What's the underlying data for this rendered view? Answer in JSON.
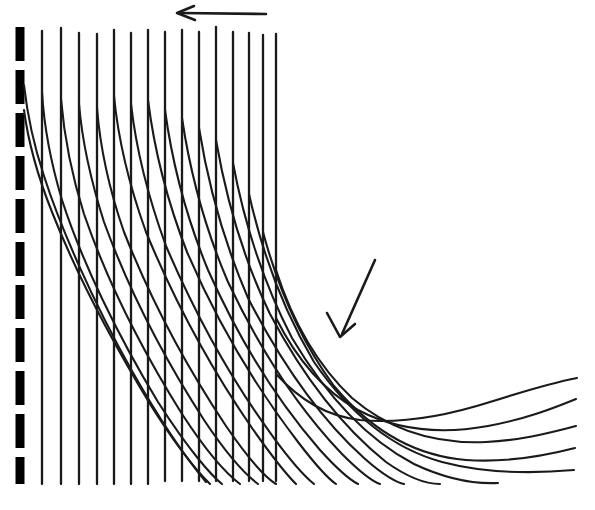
{
  "figure": {
    "domain": "diagram",
    "title": "",
    "background_color": "#ffffff",
    "ink_color": "#1a1a1a",
    "width": 595,
    "height": 510
  },
  "wall": {
    "name": "dashed-boundary-wall",
    "x": 20,
    "y_top": 27,
    "y_bottom": 484,
    "stroke_width": 9,
    "color": "#000000",
    "dash_pattern": "34 9"
  },
  "timelines": {
    "name": "vertical-timeline-markers",
    "count": 15,
    "color": "#1a1a1a",
    "stroke_width": 2.3,
    "y_top": 27,
    "items": [
      {
        "x": 42,
        "y_top": 31,
        "y_bottom": 484
      },
      {
        "x": 61,
        "y_top": 28,
        "y_bottom": 484
      },
      {
        "x": 79,
        "y_top": 33,
        "y_bottom": 484
      },
      {
        "x": 97,
        "y_top": 34,
        "y_bottom": 484
      },
      {
        "x": 114,
        "y_top": 30,
        "y_bottom": 484
      },
      {
        "x": 131,
        "y_top": 33,
        "y_bottom": 484
      },
      {
        "x": 148,
        "y_top": 30,
        "y_bottom": 484
      },
      {
        "x": 165,
        "y_top": 32,
        "y_bottom": 481
      },
      {
        "x": 182,
        "y_top": 30,
        "y_bottom": 481
      },
      {
        "x": 199,
        "y_top": 32,
        "y_bottom": 481
      },
      {
        "x": 216,
        "y_top": 27,
        "y_bottom": 481
      },
      {
        "x": 233,
        "y_top": 32,
        "y_bottom": 481
      },
      {
        "x": 249,
        "y_top": 33,
        "y_bottom": 481
      },
      {
        "x": 263,
        "y_top": 35,
        "y_bottom": 481
      },
      {
        "x": 276,
        "y_top": 34,
        "y_bottom": 481
      }
    ]
  },
  "streamlines": {
    "name": "curved-streamlines",
    "count": 18,
    "color": "#1a1a1a",
    "stroke_width": 2.1,
    "note": "Each curve starts on the wall or on a vertical marker and sweeps down-right, flattening into a near-horizontal tail at the right edge.",
    "paths": [
      "M 24,85 C 27,112 32,140 44,176 C 60,226 92,300 132,371 C 170,438 196,470 206,482",
      "M 24,110 C 28,140 36,172 52,212 C 74,268 110,338 150,404 C 180,452 200,474 210,484",
      "M 42,92 C 44,126 50,160 62,200 C 82,262 118,336 158,402 C 190,452 212,476 222,484",
      "M 61,99 C 64,134 70,170 84,214 C 106,278 142,350 182,414 C 212,460 232,478 240,484",
      "M 79,104 C 82,140 90,178 104,222 C 128,288 164,358 204,420 C 232,462 250,478 258,484",
      "M 97,108 C 100,146 108,186 124,232 C 150,298 186,366 226,426 C 252,464 268,479 276,484",
      "M 114,96 C 118,138 128,182 146,232 C 174,300 212,370 252,428 C 276,462 290,478 296,484",
      "M 131,104 C 136,148 147,194 166,246 C 196,316 234,384 274,438 C 296,468 308,479 314,484",
      "M 148,100 C 154,148 166,198 187,252 C 218,324 258,390 298,442 C 318,468 330,480 336,484",
      "M 165,110 C 172,162 185,214 208,270 C 240,342 280,404 320,450 C 340,472 352,481 358,484",
      "M 182,118 C 190,172 204,226 228,282 C 262,354 302,412 342,454 C 362,474 374,482 380,484",
      "M 199,128 C 208,184 223,240 248,298 C 284,368 324,422 364,458 C 384,476 398,483 404,484",
      "M 216,140 C 226,198 242,256 270,314 C 306,382 346,430 386,462 C 410,479 428,484 440,484",
      "M 233,163 C 244,222 262,280 292,338 C 330,402 372,442 414,464 C 448,480 478,484 498,483",
      "M 249,194 C 262,252 282,308 314,362 C 354,420 398,450 442,462 C 484,473 530,474 574,470",
      "M 263,232 C 278,288 300,340 334,386 C 376,436 420,456 466,460 C 508,463 544,456 575,448",
      "M 276,270 C 292,320 316,364 352,398 C 394,434 440,444 486,442 C 524,440 552,432 576,426",
      "M 276,318 C 296,358 322,390 358,410 C 400,432 444,434 488,426 C 526,419 554,408 576,399",
      "M 276,374 C 300,400 326,416 360,420 C 402,424 446,416 490,402 C 528,390 556,382 577,378"
    ]
  },
  "annotations": {
    "name": "flow-direction-arrows",
    "items": [
      {
        "name": "freestream-direction-arrow",
        "label": "",
        "direction": "left",
        "shaft_path": "M 266,14 L 180,13",
        "head_path": "M 194,6 L 177,13 L 195,20"
      },
      {
        "name": "streamline-callout-arrow",
        "label": "",
        "direction": "down-left",
        "shaft_path": "M 375,260 L 342,334",
        "head_path": "M 327,313 L 340,337 L 355,324"
      }
    ]
  }
}
